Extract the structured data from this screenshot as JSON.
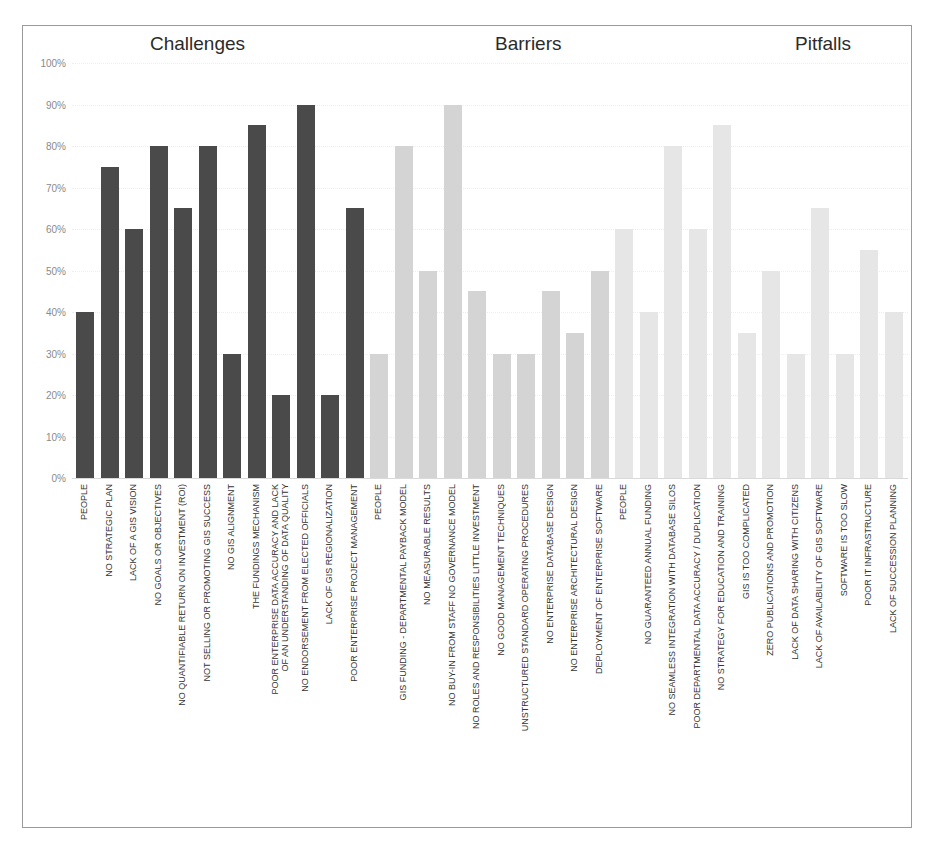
{
  "chart_data": {
    "type": "bar",
    "title": "",
    "group_titles": [
      "Challenges",
      "Barriers",
      "Pitfalls"
    ],
    "xlabel": "",
    "ylabel": "",
    "ylim": [
      0,
      100
    ],
    "yticks": [
      "0%",
      "10%",
      "20%",
      "30%",
      "40%",
      "50%",
      "60%",
      "70%",
      "80%",
      "90%",
      "100%"
    ],
    "grid": true,
    "legend": "none",
    "colors": {
      "Challenges": "#4a4a4a",
      "Barriers": "#d4d4d4",
      "Pitfalls": "#e6e6e6"
    },
    "series": [
      {
        "name": "Challenges",
        "categories": [
          "PEOPLE",
          "NO STRATEGIC PLAN",
          "LACK OF A GIS VISION",
          "NO GOALS OR OBJECTIVES",
          "NO QUANTIFIABLE RETURN ON INVESTMENT (ROI)",
          "NOT SELLING OR PROMOTING GIS SUCCESS",
          "NO GIS ALIGNMENT",
          "THE FUNDINGS MECHANISM",
          "POOR ENTERPRISE DATA ACCURACY AND LACK OF AN UNDERSTANDING OF DATA QUALITY",
          "NO ENDORSEMENT FROM ELECTED OFFICIALS",
          "LACK OF GIS REGIONALIZATION",
          "POOR ENTERPRISE PROJECT MANAGEMENT"
        ],
        "values": [
          40,
          75,
          60,
          80,
          65,
          80,
          30,
          85,
          20,
          90,
          20,
          65
        ]
      },
      {
        "name": "Barriers",
        "categories": [
          "PEOPLE",
          "GIS FUNDING - DEPARTMENTAL PAYBACK MODEL",
          "NO MEASURABLE RESULTS",
          "NO BUY-IN FROM STAFF NO GOVERNANCE MODEL",
          "NO ROLES AND RESPONSIBILITIES LITTLE INVESTMENT",
          "NO GOOD MANAGEMENT TECHNIQUES",
          "UNSTRUCTURED STANDARD OPERATING PROCEDURES",
          "NO ENTERPRISE DATABASE DESIGN",
          "NO ENTERPRISE ARCHITECTURAL DESIGN",
          "DEPLOYMENT OF ENTERPRISE SOFTWARE"
        ],
        "values": [
          30,
          80,
          50,
          90,
          45,
          30,
          30,
          45,
          35,
          50
        ]
      },
      {
        "name": "Pitfalls",
        "categories": [
          "PEOPLE",
          "NO GUARANTEED ANNUAL FUNDING",
          "NO SEAMLESS INTEGRATION WITH DATABASE SILOS",
          "POOR DEPARTMENTAL DATA ACCURACY / DUPLICATION",
          "NO STRATEGY FOR EDUCATION AND TRAINING",
          "GIS IS TOO COMPLICATED",
          "ZERO PUBLICATIONS AND PROMOTION",
          "LACK OF DATA SHARING WITH CITIZENS",
          "LACK OF AVAILABILITY OF GIS SOFTWARE",
          "SOFTWARE IS TOO SLOW",
          "POOR IT INFRASTRUCTURE",
          "LACK OF SUCCESSION PLANNING"
        ],
        "values": [
          60,
          40,
          80,
          60,
          85,
          35,
          50,
          30,
          65,
          30,
          55,
          40
        ]
      }
    ]
  }
}
